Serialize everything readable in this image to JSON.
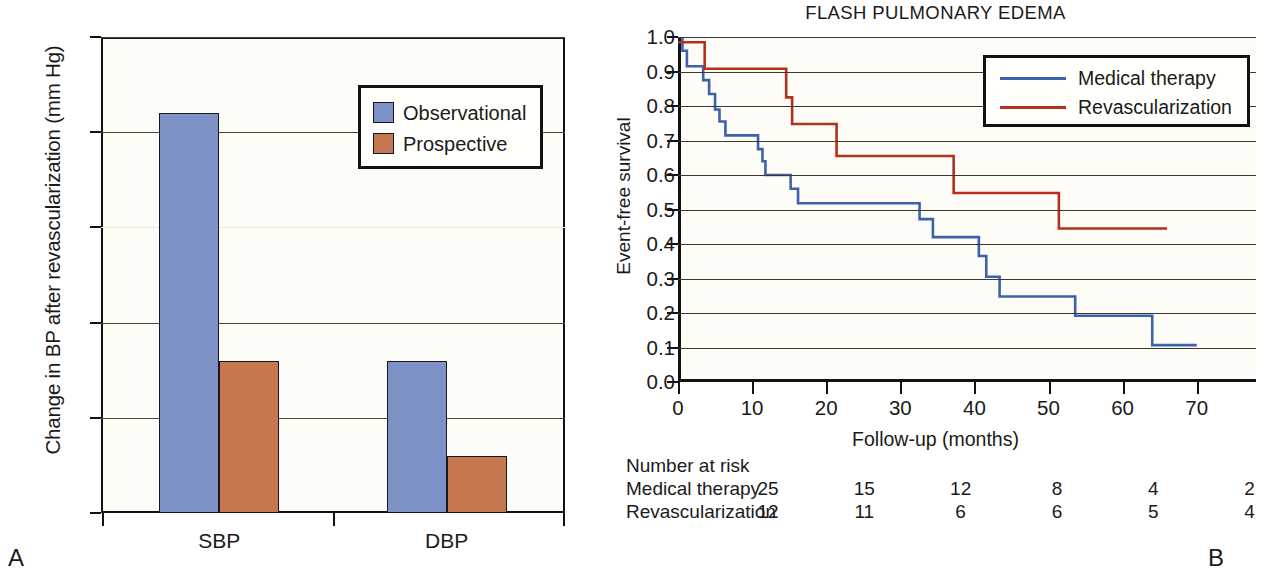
{
  "figure": {
    "panel_a_letter": "A",
    "panel_b_letter": "B"
  },
  "panel_a": {
    "ylabel": "Change in BP after revascularization (mm Hg)",
    "y_ticks": [
      "−25",
      "−20",
      "15",
      "−10",
      "−5",
      "0"
    ],
    "x_categories": [
      "SBP",
      "DBP"
    ],
    "legend": [
      {
        "label": "Observational",
        "color": "#7d91c6"
      },
      {
        "label": "Prospective",
        "color": "#c5774f"
      }
    ],
    "chart_data": {
      "type": "bar",
      "title": "",
      "xlabel": "",
      "ylabel": "Change in BP after revascularization (mm Hg)",
      "categories": [
        "SBP",
        "DBP"
      ],
      "series": [
        {
          "name": "Observational",
          "values": [
            21,
            8
          ],
          "color": "#7d91c6"
        },
        {
          "name": "Prospective",
          "values": [
            8,
            3
          ],
          "color": "#c5774f"
        }
      ],
      "ylim": [
        0,
        25
      ],
      "y_tick_values": [
        25,
        20,
        15,
        10,
        5,
        0
      ],
      "y_tick_labels": [
        "−25",
        "−20",
        "15",
        "−10",
        "−5",
        "0"
      ],
      "axis_note": "y axis inverted: magnitude of BP reduction, labelled negative",
      "grid": true,
      "legend_position": "upper right"
    }
  },
  "panel_b": {
    "title": "FLASH PULMONARY EDEMA",
    "ylabel": "Event-free survival",
    "xlabel": "Follow-up (months)",
    "y_ticks": [
      "1.0",
      "0.9",
      "0.8",
      "0.7",
      "0.6",
      "0.5",
      "0.4",
      "0.3",
      "0.2",
      "0.1",
      "0.0"
    ],
    "x_ticks": [
      "0",
      "10",
      "20",
      "30",
      "40",
      "50",
      "60",
      "70"
    ],
    "legend": [
      {
        "label": "Medical therapy",
        "color": "#3d62ad"
      },
      {
        "label": "Revascularization",
        "color": "#b3301e"
      }
    ],
    "risk_table": {
      "header": "Number at risk",
      "rows": [
        {
          "name": "Medical therapy",
          "values": [
            "25",
            "15",
            "12",
            "8",
            "4",
            "2"
          ]
        },
        {
          "name": "Revascularization",
          "values": [
            "12",
            "11",
            "6",
            "6",
            "5",
            "4"
          ]
        }
      ],
      "value_x_months": [
        0,
        13,
        26,
        39,
        52,
        65
      ]
    },
    "chart_data": {
      "type": "line",
      "subtype": "kaplan-meier-step",
      "title": "FLASH PULMONARY EDEMA",
      "xlabel": "Follow-up (months)",
      "ylabel": "Event-free survival",
      "xlim": [
        0,
        78
      ],
      "ylim": [
        0,
        1.0
      ],
      "x_tick_values": [
        0,
        10,
        20,
        30,
        40,
        50,
        60,
        70
      ],
      "y_tick_values": [
        0,
        0.1,
        0.2,
        0.3,
        0.4,
        0.5,
        0.6,
        0.7,
        0.8,
        0.9,
        1.0
      ],
      "grid": true,
      "legend_position": "upper right",
      "series": [
        {
          "name": "Medical therapy",
          "color": "#3d62ad",
          "steps": [
            [
              0,
              1.0
            ],
            [
              0.6,
              0.96
            ],
            [
              1.2,
              0.915
            ],
            [
              2.8,
              0.915
            ],
            [
              3.4,
              0.875
            ],
            [
              4.2,
              0.835
            ],
            [
              5.0,
              0.79
            ],
            [
              5.6,
              0.755
            ],
            [
              6.4,
              0.715
            ],
            [
              10.2,
              0.715
            ],
            [
              10.8,
              0.675
            ],
            [
              11.4,
              0.64
            ],
            [
              11.8,
              0.6
            ],
            [
              14.6,
              0.6
            ],
            [
              15.2,
              0.56
            ],
            [
              16.2,
              0.518
            ],
            [
              31.4,
              0.518
            ],
            [
              32.6,
              0.472
            ],
            [
              34.4,
              0.42
            ],
            [
              40.0,
              0.42
            ],
            [
              40.6,
              0.365
            ],
            [
              41.6,
              0.305
            ],
            [
              43.4,
              0.248
            ],
            [
              53.0,
              0.248
            ],
            [
              53.6,
              0.192
            ],
            [
              63.4,
              0.192
            ],
            [
              64.0,
              0.107
            ],
            [
              70.0,
              0.107
            ]
          ]
        },
        {
          "name": "Revascularization",
          "color": "#b3301e",
          "steps": [
            [
              0,
              0.985
            ],
            [
              3.2,
              0.985
            ],
            [
              3.6,
              0.908
            ],
            [
              14.0,
              0.908
            ],
            [
              14.6,
              0.825
            ],
            [
              15.4,
              0.748
            ],
            [
              21.0,
              0.748
            ],
            [
              21.4,
              0.655
            ],
            [
              36.6,
              0.655
            ],
            [
              37.2,
              0.548
            ],
            [
              50.8,
              0.548
            ],
            [
              51.4,
              0.445
            ],
            [
              66.0,
              0.445
            ]
          ]
        }
      ]
    }
  }
}
